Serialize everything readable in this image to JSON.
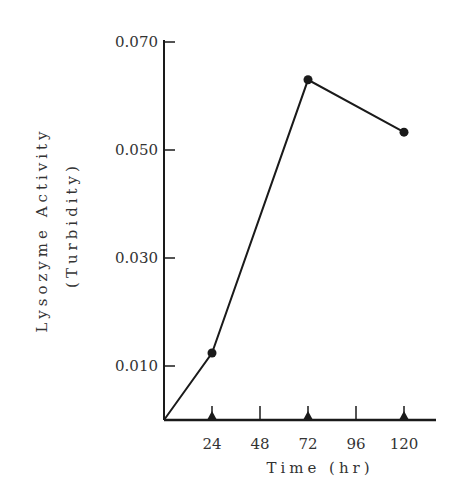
{
  "chart_data": {
    "type": "line",
    "title": "",
    "xlabel": "Time (hr)",
    "ylabel_line1": "Lysozyme Activity",
    "ylabel_line2": "(Turbidity)",
    "x": [
      0,
      24,
      72,
      120
    ],
    "series": [
      {
        "name": "Lysozyme Activity",
        "values": [
          0.0,
          0.0124,
          0.063,
          0.0533
        ],
        "markers": [
          false,
          true,
          true,
          true
        ]
      }
    ],
    "xlim": [
      0,
      136
    ],
    "ylim": [
      0,
      0.07
    ],
    "x_ticks": [
      24,
      48,
      72,
      96,
      120
    ],
    "x_tick_labels": [
      "24",
      "48",
      "72",
      "96",
      "120"
    ],
    "x_triangle_markers": [
      24,
      72,
      120
    ],
    "y_ticks": [
      0.01,
      0.03,
      0.05,
      0.07
    ],
    "y_tick_labels": [
      "0.010",
      "0.030",
      "0.050",
      "0.070"
    ],
    "grid": false,
    "legend": "none",
    "line_color": "#1a1a1a"
  }
}
